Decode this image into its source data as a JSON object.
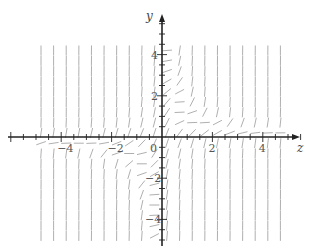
{
  "chart_data": {
    "type": "slope_field",
    "title": "",
    "xlabel": "z",
    "ylabel": "y",
    "xlim": [
      -5.5,
      5.5
    ],
    "ylim": [
      -5,
      5
    ],
    "x_ticks": [
      {
        "value": -4,
        "label": "-4"
      },
      {
        "value": -2,
        "label": "-2"
      },
      {
        "value": 0,
        "label": "0"
      },
      {
        "value": 2,
        "label": "2"
      },
      {
        "value": 4,
        "label": "4"
      }
    ],
    "y_ticks": [
      {
        "value": 4,
        "label": "4"
      },
      {
        "value": 2,
        "label": "2"
      },
      {
        "value": -2,
        "label": "-2"
      },
      {
        "value": -4,
        "label": "-4"
      }
    ],
    "minor_tick_step": 0.5,
    "grid": false,
    "field": {
      "description": "Direction field; segments are steep positive almost everywhere, flattening to horizontal along a hyperbola-like curve (y≈1/z): near y≈0.5 for z>1 and y≈-1 for z<-1.",
      "x_range": [
        -4.8,
        4.8
      ],
      "y_range": [
        -4.8,
        4.4
      ],
      "x_step": 0.5,
      "y_step": 0.5,
      "segment_length_px": 10,
      "color": "#9a9a9a"
    },
    "axis_color": "#222222"
  }
}
